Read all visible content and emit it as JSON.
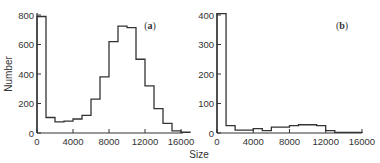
{
  "chart_data": [
    {
      "type": "bar",
      "panel_label": "(a)",
      "panel_letter": "a",
      "title": "",
      "xlabel": "Size",
      "ylabel": "Number",
      "bin_width": 1000,
      "bin_edges_start": [
        0,
        1000,
        2000,
        3000,
        4000,
        5000,
        6000,
        7000,
        8000,
        9000,
        10000,
        11000,
        12000,
        13000,
        14000,
        15000,
        16000
      ],
      "values": [
        790,
        105,
        75,
        80,
        95,
        120,
        230,
        380,
        620,
        725,
        715,
        500,
        320,
        165,
        65,
        15,
        5
      ],
      "xlim": [
        0,
        17000
      ],
      "ylim": [
        0,
        800
      ],
      "xticks": [
        0,
        4000,
        8000,
        12000,
        16000
      ],
      "xtick_labels": [
        "0",
        "4000",
        "8000",
        "12000",
        "16000"
      ],
      "yticks": [
        0,
        200,
        400,
        600,
        800
      ],
      "ytick_labels": [
        "0",
        "200",
        "400",
        "600",
        "800"
      ],
      "grid": false,
      "style": "step histogram"
    },
    {
      "type": "bar",
      "panel_label": "(b)",
      "panel_letter": "b",
      "title": "",
      "xlabel": "Size",
      "ylabel": "Number",
      "bin_width": 1000,
      "bin_edges_start": [
        0,
        1000,
        2000,
        3000,
        4000,
        5000,
        6000,
        7000,
        8000,
        9000,
        10000,
        11000,
        12000,
        13000,
        14000,
        15000
      ],
      "values": [
        405,
        25,
        10,
        10,
        15,
        8,
        20,
        20,
        25,
        28,
        28,
        25,
        8,
        2,
        2,
        2
      ],
      "xlim": [
        0,
        16000
      ],
      "ylim": [
        0,
        400
      ],
      "xticks": [
        0,
        4000,
        8000,
        12000,
        16000
      ],
      "xtick_labels": [
        "0",
        "4000",
        "8000",
        "12000",
        "16000"
      ],
      "yticks": [
        0,
        100,
        200,
        300,
        400
      ],
      "ytick_labels": [
        "0",
        "100",
        "200",
        "300",
        "400"
      ],
      "grid": false,
      "style": "step histogram"
    }
  ],
  "labels": {
    "ylabel": "Number",
    "xlabel": "Size"
  },
  "colors": {
    "line": "#333333",
    "text": "#333333",
    "background": "#ffffff"
  }
}
